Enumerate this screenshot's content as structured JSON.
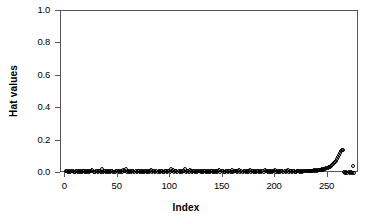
{
  "chart_data": {
    "type": "scatter",
    "title": "",
    "xlabel": "Index",
    "ylabel": "Hat values",
    "xlim": [
      -4,
      280
    ],
    "ylim": [
      0.0,
      1.0
    ],
    "grid": false,
    "legend": "none",
    "marker": "open-circle",
    "marker_color": "#000000",
    "frame_color": "#555555",
    "xticks": [
      0,
      50,
      100,
      150,
      200,
      250
    ],
    "xtick_labels": [
      "0",
      "50",
      "100",
      "150",
      "200",
      "250"
    ],
    "yticks": [
      0.0,
      0.2,
      0.4,
      0.6,
      0.8,
      1.0
    ],
    "ytick_labels": [
      "0.0",
      "0.2",
      "0.4",
      "0.6",
      "0.8",
      "1.0"
    ],
    "n_points": 275,
    "x": [
      1,
      2,
      3,
      4,
      5,
      6,
      7,
      8,
      9,
      10,
      11,
      12,
      13,
      14,
      15,
      16,
      17,
      18,
      19,
      20,
      21,
      22,
      23,
      24,
      25,
      26,
      27,
      28,
      29,
      30,
      31,
      32,
      33,
      34,
      35,
      36,
      37,
      38,
      39,
      40,
      41,
      42,
      43,
      44,
      45,
      46,
      47,
      48,
      49,
      50,
      51,
      52,
      53,
      54,
      55,
      56,
      57,
      58,
      59,
      60,
      61,
      62,
      63,
      64,
      65,
      66,
      67,
      68,
      69,
      70,
      71,
      72,
      73,
      74,
      75,
      76,
      77,
      78,
      79,
      80,
      81,
      82,
      83,
      84,
      85,
      86,
      87,
      88,
      89,
      90,
      91,
      92,
      93,
      94,
      95,
      96,
      97,
      98,
      99,
      100,
      101,
      102,
      103,
      104,
      105,
      106,
      107,
      108,
      109,
      110,
      111,
      112,
      113,
      114,
      115,
      116,
      117,
      118,
      119,
      120,
      121,
      122,
      123,
      124,
      125,
      126,
      127,
      128,
      129,
      130,
      131,
      132,
      133,
      134,
      135,
      136,
      137,
      138,
      139,
      140,
      141,
      142,
      143,
      144,
      145,
      146,
      147,
      148,
      149,
      150,
      151,
      152,
      153,
      154,
      155,
      156,
      157,
      158,
      159,
      160,
      161,
      162,
      163,
      164,
      165,
      166,
      167,
      168,
      169,
      170,
      171,
      172,
      173,
      174,
      175,
      176,
      177,
      178,
      179,
      180,
      181,
      182,
      183,
      184,
      185,
      186,
      187,
      188,
      189,
      190,
      191,
      192,
      193,
      194,
      195,
      196,
      197,
      198,
      199,
      200,
      201,
      202,
      203,
      204,
      205,
      206,
      207,
      208,
      209,
      210,
      211,
      212,
      213,
      214,
      215,
      216,
      217,
      218,
      219,
      220,
      221,
      222,
      223,
      224,
      225,
      226,
      227,
      228,
      229,
      230,
      231,
      232,
      233,
      234,
      235,
      236,
      237,
      238,
      239,
      240,
      241,
      242,
      243,
      244,
      245,
      246,
      247,
      248,
      249,
      250,
      251,
      252,
      253,
      254,
      255,
      256,
      257,
      258,
      259,
      260,
      261,
      262,
      263,
      264,
      265,
      266,
      267,
      268,
      269,
      270,
      271,
      272,
      273,
      274,
      275
    ],
    "y": [
      0.013,
      0.011,
      0.009,
      0.012,
      0.008,
      0.01,
      0.014,
      0.009,
      0.007,
      0.011,
      0.01,
      0.008,
      0.012,
      0.009,
      0.011,
      0.007,
      0.013,
      0.01,
      0.008,
      0.012,
      0.009,
      0.011,
      0.008,
      0.014,
      0.01,
      0.019,
      0.009,
      0.007,
      0.012,
      0.01,
      0.008,
      0.013,
      0.011,
      0.009,
      0.022,
      0.008,
      0.012,
      0.01,
      0.007,
      0.011,
      0.009,
      0.013,
      0.008,
      0.01,
      0.012,
      0.009,
      0.007,
      0.011,
      0.01,
      0.008,
      0.013,
      0.009,
      0.011,
      0.007,
      0.02,
      0.01,
      0.012,
      0.022,
      0.008,
      0.011,
      0.009,
      0.013,
      0.007,
      0.01,
      0.012,
      0.008,
      0.011,
      0.009,
      0.013,
      0.01,
      0.007,
      0.012,
      0.008,
      0.011,
      0.009,
      0.014,
      0.01,
      0.007,
      0.012,
      0.009,
      0.011,
      0.019,
      0.008,
      0.013,
      0.01,
      0.007,
      0.012,
      0.009,
      0.011,
      0.008,
      0.01,
      0.013,
      0.009,
      0.007,
      0.012,
      0.011,
      0.008,
      0.01,
      0.013,
      0.009,
      0.023,
      0.011,
      0.021,
      0.008,
      0.012,
      0.01,
      0.007,
      0.013,
      0.009,
      0.011,
      0.008,
      0.012,
      0.01,
      0.022,
      0.007,
      0.011,
      0.013,
      0.009,
      0.02,
      0.012,
      0.008,
      0.01,
      0.014,
      0.009,
      0.011,
      0.007,
      0.012,
      0.01,
      0.008,
      0.013,
      0.009,
      0.011,
      0.01,
      0.007,
      0.012,
      0.008,
      0.013,
      0.009,
      0.011,
      0.01,
      0.008,
      0.012,
      0.007,
      0.013,
      0.009,
      0.011,
      0.02,
      0.008,
      0.01,
      0.012,
      0.009,
      0.007,
      0.013,
      0.011,
      0.008,
      0.01,
      0.012,
      0.009,
      0.021,
      0.007,
      0.011,
      0.013,
      0.01,
      0.008,
      0.012,
      0.02,
      0.009,
      0.011,
      0.007,
      0.013,
      0.01,
      0.008,
      0.012,
      0.009,
      0.011,
      0.019,
      0.007,
      0.01,
      0.013,
      0.008,
      0.012,
      0.009,
      0.011,
      0.01,
      0.007,
      0.013,
      0.008,
      0.012,
      0.009,
      0.021,
      0.011,
      0.01,
      0.007,
      0.013,
      0.008,
      0.012,
      0.009,
      0.011,
      0.01,
      0.02,
      0.007,
      0.013,
      0.008,
      0.012,
      0.009,
      0.011,
      0.01,
      0.008,
      0.013,
      0.007,
      0.012,
      0.019,
      0.009,
      0.011,
      0.01,
      0.008,
      0.013,
      0.012,
      0.007,
      0.009,
      0.011,
      0.01,
      0.013,
      0.008,
      0.012,
      0.009,
      0.011,
      0.014,
      0.01,
      0.012,
      0.013,
      0.011,
      0.014,
      0.012,
      0.015,
      0.013,
      0.016,
      0.014,
      0.017,
      0.015,
      0.018,
      0.016,
      0.02,
      0.018,
      0.022,
      0.021,
      0.024,
      0.026,
      0.028,
      0.031,
      0.034,
      0.038,
      0.042,
      0.047,
      0.053,
      0.06,
      0.068,
      0.077,
      0.088,
      0.1,
      0.112,
      0.124,
      0.133,
      0.139,
      0.141,
      0.004,
      0.003,
      0.004,
      0.003,
      0.004,
      0.003,
      0.004,
      0.003,
      0.045,
      0.003,
      0.004
    ]
  }
}
